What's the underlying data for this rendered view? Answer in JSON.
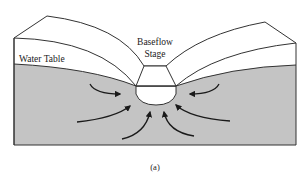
{
  "figure": {
    "labels": {
      "water_table": "Water Table",
      "baseflow_line1": "Baseflow",
      "baseflow_line2": "Stage",
      "caption": "(a)"
    },
    "colors": {
      "background": "#ffffff",
      "saturated_zone": "#c4c4c4",
      "outline": "#333333",
      "arrow": "#1a1a1a",
      "channel_water": "#ffffff"
    },
    "arrows": {
      "count": 6,
      "direction": "toward-channel",
      "meaning": "groundwater flow"
    }
  }
}
